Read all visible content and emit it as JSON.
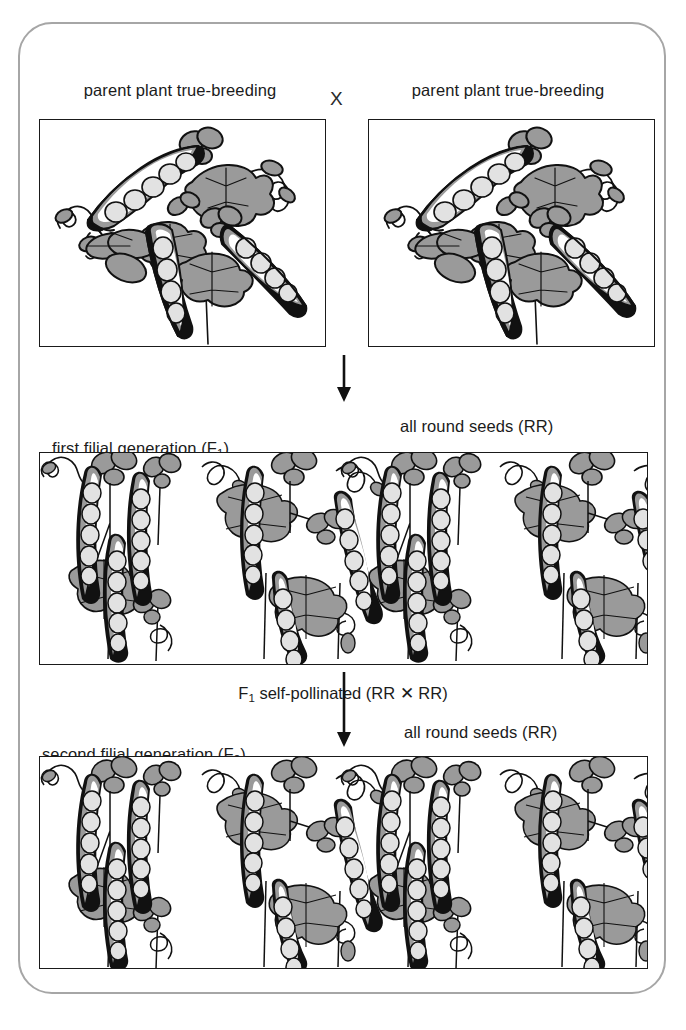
{
  "figure": {
    "type": "genetics-cross-diagram",
    "frame_color": "#a6a6a6",
    "panel_border_color": "#1a1a1a",
    "pod_color": "#9a9a9a",
    "seed_color": "#e2e2e2",
    "leaf_color": "#9a9a9a",
    "outline_color": "#111111"
  },
  "parents": {
    "cross_symbol": "X",
    "left": {
      "caption_line1": "parent plant true-breeding",
      "caption_line2": "for round seeds (RR)",
      "genotype": "RR",
      "phenotype": "round seeds"
    },
    "right": {
      "caption_line1": "parent plant true-breeding",
      "caption_line2": "for round seeds (RR)",
      "genotype": "RR",
      "phenotype": "round seeds"
    }
  },
  "f1": {
    "label_prefix": "first filial generation (F",
    "label_subscript": "1",
    "label_suffix": ")",
    "result": "all round seeds (RR)",
    "genotype": "RR",
    "plant_clusters": 4
  },
  "selfpollination": {
    "prefix": "F",
    "subscript": "1",
    "suffix": " self-pollinated (RR ✕ RR)"
  },
  "f2": {
    "label_prefix": "second filial generation (F",
    "label_subscript": "2",
    "label_suffix": ")",
    "result": "all round seeds (RR)",
    "genotype": "RR",
    "plant_clusters": 4
  }
}
